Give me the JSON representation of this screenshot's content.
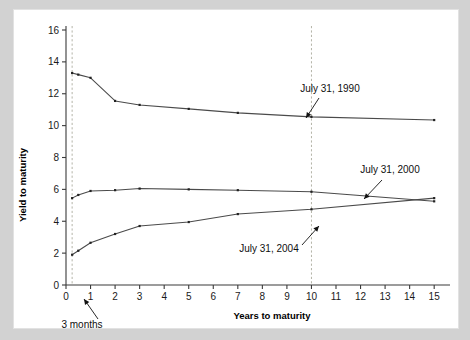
{
  "figure": {
    "background_color": "#d2d2d2",
    "plot_background_color": "#ffffff"
  },
  "chart_data": {
    "type": "line",
    "title": "",
    "subtitle": "",
    "xlabel": "Years to maturity",
    "ylabel": "Yield to maturity",
    "xlim": [
      0,
      15.4
    ],
    "ylim": [
      0,
      16
    ],
    "x_ticks": [
      0,
      1,
      2,
      3,
      4,
      5,
      6,
      7,
      8,
      9,
      10,
      11,
      12,
      13,
      14,
      15
    ],
    "x_tick_labels": [
      "0",
      "1",
      "2",
      "3",
      "4",
      "5",
      "6",
      "7",
      "8",
      "9",
      "10",
      "11",
      "12",
      "13",
      "14",
      "15"
    ],
    "y_ticks": [
      0,
      2,
      4,
      6,
      8,
      10,
      12,
      14,
      16
    ],
    "y_tick_labels": [
      "0",
      "2",
      "4",
      "6",
      "8",
      "10",
      "12",
      "14",
      "16"
    ],
    "grid": false,
    "legend_position": "inline-annotations",
    "line_color": "#4a4a4a",
    "marker_color": "#222222",
    "reference_line_color": "#b4b4a8",
    "series": [
      {
        "name": "July 31, 1990",
        "x": [
          0.25,
          0.5,
          1,
          2,
          3,
          5,
          7,
          10,
          15
        ],
        "values": [
          13.3,
          13.2,
          13.0,
          11.55,
          11.3,
          11.05,
          10.8,
          10.55,
          10.35
        ]
      },
      {
        "name": "July 31, 2000",
        "x": [
          0.25,
          0.5,
          1,
          2,
          3,
          5,
          7,
          10,
          15
        ],
        "values": [
          5.45,
          5.65,
          5.9,
          5.95,
          6.05,
          6.0,
          5.95,
          5.85,
          5.25
        ]
      },
      {
        "name": "July 31, 2004",
        "x": [
          0.25,
          0.5,
          1,
          2,
          3,
          5,
          7,
          10,
          15
        ],
        "values": [
          1.9,
          2.15,
          2.65,
          3.2,
          3.7,
          3.95,
          4.45,
          4.75,
          5.45
        ]
      }
    ],
    "reference_lines": [
      {
        "name": "3-months-vertical",
        "x": 0.25,
        "orientation": "vertical"
      },
      {
        "name": "10-years-vertical",
        "x": 10,
        "orientation": "vertical"
      }
    ],
    "annotations": [
      {
        "name": "annotation-1990",
        "text": "July 31, 1990",
        "label_x": 316,
        "label_y": 82,
        "arrow_from_x": 305,
        "arrow_from_y": 88,
        "arrow_to_x": 292,
        "arrow_to_y": 108
      },
      {
        "name": "annotation-2000",
        "text": "July 31, 2000",
        "label_x": 376,
        "label_y": 163,
        "arrow_from_x": 368,
        "arrow_from_y": 170,
        "arrow_to_x": 350,
        "arrow_to_y": 189
      },
      {
        "name": "annotation-2004",
        "text": "July 31, 2004",
        "label_x": 255,
        "label_y": 242,
        "arrow_from_x": 288,
        "arrow_from_y": 235,
        "arrow_to_x": 305,
        "arrow_to_y": 216
      },
      {
        "name": "annotation-3-months",
        "text": "3 months",
        "label_x": 68,
        "label_y": 318,
        "arrow_from_x": 84,
        "arrow_from_y": 309,
        "arrow_to_x": 70,
        "arrow_to_y": 289
      }
    ]
  }
}
